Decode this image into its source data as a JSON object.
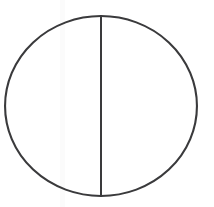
{
  "figure": {
    "caption": "",
    "background_color": "#ffffff",
    "canvas": {
      "width": 214,
      "height": 207
    },
    "shapes": {
      "circle": {
        "name": "circle-outline",
        "center_x": 101,
        "center_y": 106,
        "radius_x": 97,
        "radius_y": 91,
        "stroke_color": "#3a3a3c",
        "stroke_width": 2.1,
        "fill": "none"
      },
      "divider": {
        "name": "vertical-diameter-line",
        "x": 101,
        "y_top": 16,
        "y_bottom": 196,
        "stroke_color": "#3a3a3c",
        "stroke_width": 2.0,
        "orientation": "vertical"
      },
      "scan_artifact": {
        "name": "scan-band",
        "x": 60,
        "width": 5,
        "color": "#fbfbfb"
      }
    }
  }
}
